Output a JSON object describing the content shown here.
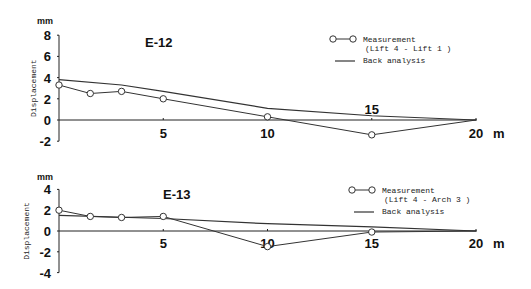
{
  "chart_data": [
    {
      "type": "line",
      "title": "E-12",
      "ylabel": "Displacement",
      "yunit": "mm",
      "xunit": "m",
      "ylim": [
        -2,
        8
      ],
      "xlim": [
        0,
        20
      ],
      "yticks": [
        "8",
        "6",
        "4",
        "2",
        "0",
        "-2"
      ],
      "xticks": [
        "5",
        "10",
        "15",
        "20"
      ],
      "legend": {
        "measurement": "Measurement",
        "measurement_sub": "(Lift 4 - Lift 1 )",
        "back": "Back analysis"
      },
      "series": [
        {
          "name": "Measurement (Lift 4 - Lift 1)",
          "x": [
            0,
            1.5,
            3,
            5,
            10,
            15,
            20
          ],
          "values": [
            3.3,
            2.5,
            2.7,
            2.0,
            0.3,
            -1.4,
            0.0
          ]
        },
        {
          "name": "Back analysis",
          "x": [
            0,
            3,
            5,
            10,
            15,
            20
          ],
          "values": [
            3.8,
            3.3,
            2.7,
            1.1,
            0.4,
            0.0
          ]
        }
      ]
    },
    {
      "type": "line",
      "title": "E-13",
      "ylabel": "Displacement",
      "yunit": "mm",
      "xunit": "m",
      "ylim": [
        -4,
        4
      ],
      "xlim": [
        0,
        20
      ],
      "yticks": [
        "4",
        "2",
        "0",
        "-2",
        "-4"
      ],
      "xticks": [
        "5",
        "10",
        "15",
        "20"
      ],
      "legend": {
        "measurement": "Measurement",
        "measurement_sub": "(Lift 4 - Arch 3 )",
        "back": "Back analysis"
      },
      "series": [
        {
          "name": "Measurement (Lift 4 - Arch 3)",
          "x": [
            0,
            1.5,
            3,
            5,
            10,
            15,
            20
          ],
          "values": [
            2.0,
            1.4,
            1.3,
            1.4,
            -1.5,
            -0.1,
            0.0
          ]
        },
        {
          "name": "Back analysis",
          "x": [
            0,
            5,
            10,
            15,
            20
          ],
          "values": [
            1.5,
            1.2,
            0.7,
            0.4,
            0.0
          ]
        }
      ]
    }
  ]
}
